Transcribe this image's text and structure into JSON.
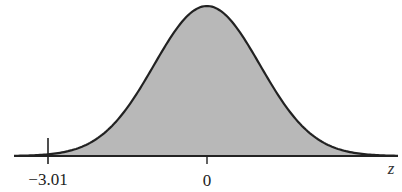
{
  "chart_data": {
    "type": "area",
    "title": "",
    "distribution": "standard normal",
    "xlabel": "z",
    "ylabel": "",
    "tick_labels": [
      "-3.01",
      "0"
    ],
    "ticks": [
      -3.01,
      0
    ],
    "shaded_region": {
      "from": -3.01,
      "to": "infinity"
    },
    "xlim": [
      -4.1,
      3.9
    ],
    "grid": false,
    "legend": false,
    "colors": {
      "shade": "#b8b8b8",
      "curve": "#222222",
      "axis": "#222222"
    }
  },
  "labels": {
    "left_tick": "−3.01",
    "center_tick": "0",
    "axis_var": "z"
  }
}
